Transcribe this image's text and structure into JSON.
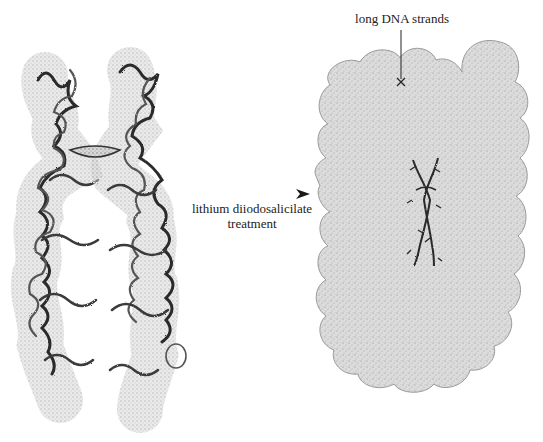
{
  "figure": {
    "type": "scientific-diagram"
  },
  "left_panel": {
    "name": "condensed-chromosome",
    "chromatids": 2
  },
  "arrow": {
    "label_line1": "lithium diiodosalicilate",
    "label_line2": "treatment",
    "direction": "right"
  },
  "right_panel": {
    "name": "scaffold-with-dna-halo",
    "annotation": "long DNA strands"
  },
  "colors": {
    "background": "#ffffff",
    "halo_fill": "#d9d9d9",
    "halo_stipple": "#9a9a9a",
    "scaffold": "#2a2a2a",
    "chromatin_loop_dark": "#2b2b2b",
    "chromatin_loop_light": "#bdbdbd",
    "text": "#222222"
  }
}
